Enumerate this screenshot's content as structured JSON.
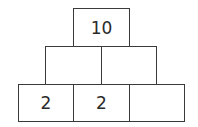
{
  "pyramid": {
    "rows": [
      {
        "cells": [
          {
            "value": "10"
          }
        ]
      },
      {
        "cells": [
          {
            "value": ""
          },
          {
            "value": ""
          }
        ]
      },
      {
        "cells": [
          {
            "value": "2"
          },
          {
            "value": "2"
          },
          {
            "value": ""
          }
        ]
      }
    ]
  }
}
